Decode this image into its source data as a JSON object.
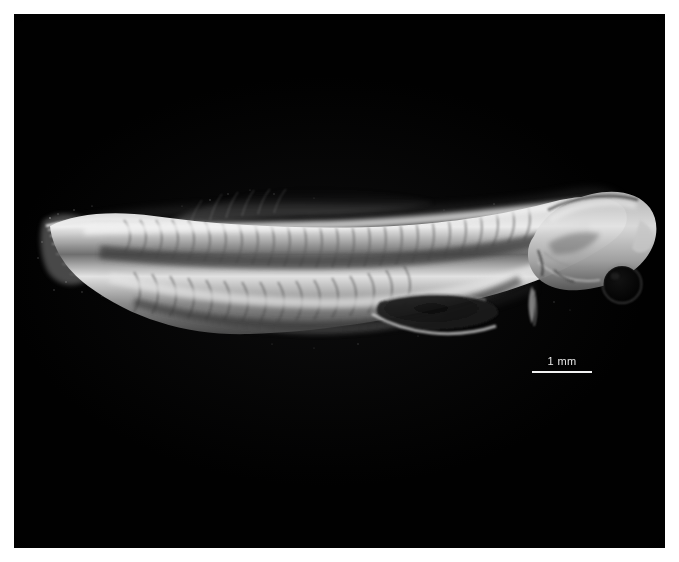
{
  "page": {
    "background_color": "#ffffff",
    "width": 679,
    "height": 562
  },
  "plate": {
    "name": "micrograph-plate",
    "background_color": "#010101",
    "left": 14,
    "top": 14,
    "width": 651,
    "height": 534
  },
  "specimen": {
    "label": "fish larva lateral view",
    "orientation": "head-right tail-left",
    "body_color_light": "#e9e9e9",
    "body_color_mid": "#9a9a9a",
    "body_color_dark": "#3a3a3a",
    "eye_color": "#060606",
    "features": [
      "caudal-fin",
      "notochord",
      "myomeres",
      "dorsal-fin-fold",
      "anal-fin-fold",
      "gut",
      "pectoral-fin",
      "head",
      "eye"
    ]
  },
  "scalebar": {
    "label": "1 mm",
    "line_color": "#f2f2f2",
    "text_color": "#e8e8e8",
    "length_px": 60
  }
}
